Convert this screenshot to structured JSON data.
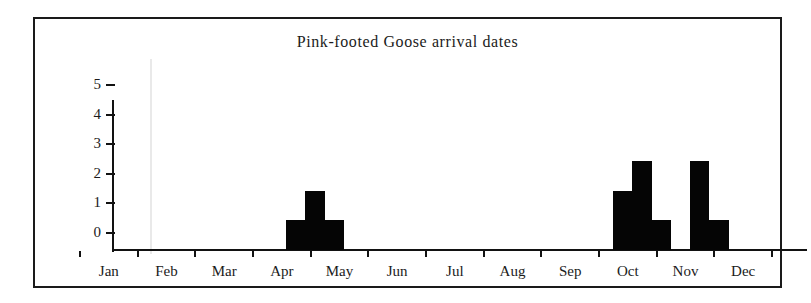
{
  "chart_data": {
    "type": "bar",
    "title": "Pink-footed Goose arrival dates",
    "xlabel": "",
    "ylabel": "",
    "ylim": [
      0,
      5
    ],
    "xlim": [
      0,
      12
    ],
    "grid": false,
    "legend": null,
    "y_ticks": [
      "5",
      "4",
      "3",
      "2",
      "1",
      "0"
    ],
    "y_tick_values": [
      5,
      4,
      3,
      2,
      1,
      0
    ],
    "categories": [
      "Jan",
      "Feb",
      "Mar",
      "Apr",
      "May",
      "Jun",
      "Jul",
      "Aug",
      "Sep",
      "Oct",
      "Nov",
      "Dec"
    ],
    "bin_note": "Counts are binned in thirds of a month (~10-day periods) across the year.",
    "bins": [
      {
        "month": "Jan",
        "third": 1,
        "value": 0
      },
      {
        "month": "Jan",
        "third": 2,
        "value": 0
      },
      {
        "month": "Jan",
        "third": 3,
        "value": 0
      },
      {
        "month": "Feb",
        "third": 1,
        "value": 0
      },
      {
        "month": "Feb",
        "third": 2,
        "value": 0
      },
      {
        "month": "Feb",
        "third": 3,
        "value": 0
      },
      {
        "month": "Mar",
        "third": 1,
        "value": 0
      },
      {
        "month": "Mar",
        "third": 2,
        "value": 0
      },
      {
        "month": "Mar",
        "third": 3,
        "value": 0
      },
      {
        "month": "Apr",
        "third": 1,
        "value": 1
      },
      {
        "month": "Apr",
        "third": 2,
        "value": 2
      },
      {
        "month": "Apr",
        "third": 3,
        "value": 1
      },
      {
        "month": "May",
        "third": 1,
        "value": 0
      },
      {
        "month": "May",
        "third": 2,
        "value": 0
      },
      {
        "month": "May",
        "third": 3,
        "value": 0
      },
      {
        "month": "Jun",
        "third": 1,
        "value": 0
      },
      {
        "month": "Jun",
        "third": 2,
        "value": 0
      },
      {
        "month": "Jun",
        "third": 3,
        "value": 0
      },
      {
        "month": "Jul",
        "third": 1,
        "value": 0
      },
      {
        "month": "Jul",
        "third": 2,
        "value": 0
      },
      {
        "month": "Jul",
        "third": 3,
        "value": 0
      },
      {
        "month": "Aug",
        "third": 1,
        "value": 0
      },
      {
        "month": "Aug",
        "third": 2,
        "value": 0
      },
      {
        "month": "Aug",
        "third": 3,
        "value": 0
      },
      {
        "month": "Sep",
        "third": 1,
        "value": 0
      },
      {
        "month": "Sep",
        "third": 2,
        "value": 0
      },
      {
        "month": "Sep",
        "third": 3,
        "value": 2
      },
      {
        "month": "Oct",
        "third": 1,
        "value": 3
      },
      {
        "month": "Oct",
        "third": 2,
        "value": 1
      },
      {
        "month": "Oct",
        "third": 3,
        "value": 0
      },
      {
        "month": "Nov",
        "third": 1,
        "value": 3
      },
      {
        "month": "Nov",
        "third": 2,
        "value": 1
      },
      {
        "month": "Nov",
        "third": 3,
        "value": 0
      },
      {
        "month": "Dec",
        "third": 1,
        "value": 0
      },
      {
        "month": "Dec",
        "third": 2,
        "value": 0
      },
      {
        "month": "Dec",
        "third": 3,
        "value": 0
      }
    ],
    "bar_color": "#050505",
    "axis_color": "#121212",
    "background_color": "#ffffff"
  }
}
